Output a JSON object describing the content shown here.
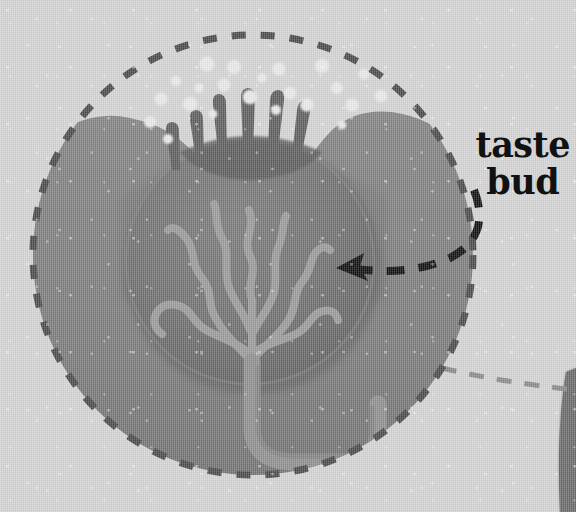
{
  "figure": {
    "kind": "anatomical-illustration",
    "background_color": "#d3d3d3"
  },
  "annotations": {
    "label_text": "taste\nbud",
    "label_color": "#111111",
    "pointer": {
      "name": "dashed-arrow",
      "style": "dashed-curve-with-arrowhead",
      "color": "#101010",
      "points_to": "taste bud body"
    },
    "callout_circle": {
      "name": "magnifier-outline",
      "style": "dashed-circle",
      "color": "#4a4a4a"
    },
    "leader_line": {
      "name": "callout-leader-line",
      "style": "dashed-line",
      "color": "#8a8a8a"
    }
  },
  "structures": [
    {
      "id": "epithelium",
      "label": "epithelium",
      "color": "#7a7a7a"
    },
    {
      "id": "taste-bud-body",
      "label": "taste bud",
      "color": "#6f6f6f"
    },
    {
      "id": "microvilli",
      "label": "microvilli / taste hairs",
      "color": "#5e5e5e",
      "count": 6
    },
    {
      "id": "taste-pore",
      "label": "taste pore",
      "color": "#5c5c5c"
    },
    {
      "id": "gustatory-cells",
      "label": "gustatory cell fibers",
      "color": "#9a9a9a",
      "count": 7
    },
    {
      "id": "nerve-fiber",
      "label": "sensory nerve fiber",
      "color": "#8f8f8f"
    },
    {
      "id": "tastant-molecules",
      "label": "tastant molecules",
      "color": "#e9e9e9",
      "count": 22
    },
    {
      "id": "tongue-surface",
      "label": "tongue surface",
      "color": "#6b6b6b"
    }
  ],
  "palette": {
    "background": "#d3d3d3",
    "epithelium": "#7a7a7a",
    "bud": "#6f6f6f",
    "bud_shadow": "#656565",
    "nerve": "#909090",
    "dot": "#e9e9e9",
    "dash_dark": "#4a4a4a",
    "arrow": "#101010",
    "leader": "#8a8a8a",
    "corner_shape": "#6b6b6b"
  }
}
